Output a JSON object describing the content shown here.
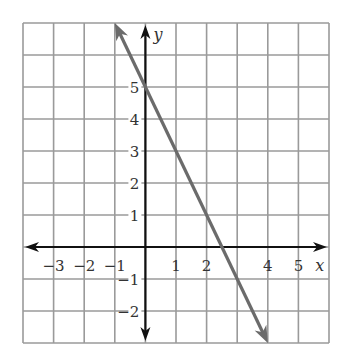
{
  "chart_data": {
    "type": "line",
    "title": "",
    "xlabel": "x",
    "ylabel": "y",
    "xlim": [
      -4,
      6
    ],
    "ylim": [
      -3,
      7
    ],
    "grid": true,
    "x_tick_labels": [
      "−3",
      "−2",
      "−1",
      "1",
      "2",
      "4",
      "5"
    ],
    "x_tick_values": [
      -3,
      -2,
      -1,
      1,
      2,
      4,
      5
    ],
    "y_tick_labels": [
      "5",
      "4",
      "3",
      "2",
      "1",
      "−1",
      "−2"
    ],
    "y_tick_values": [
      5,
      4,
      3,
      2,
      1,
      -1,
      -2
    ],
    "series": [
      {
        "name": "y = -2x + 5",
        "equation": "y = -2x + 5",
        "slope": -2,
        "y_intercept": 5,
        "x_intercept": 2.5,
        "x": [
          -1,
          4
        ],
        "y": [
          7,
          -3
        ],
        "arrows": "both",
        "color": "#6b6b6b"
      }
    ]
  },
  "colors": {
    "grid": "#9a9a9a",
    "axes": "#111111",
    "line": "#6b6b6b",
    "background": "#ffffff"
  }
}
